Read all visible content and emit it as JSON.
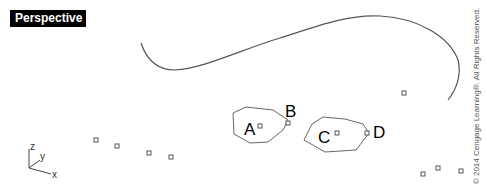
{
  "viewport": {
    "label": "Perspective"
  },
  "axis_icon": {
    "z_label": "z",
    "y_label": "y",
    "x_label": "x"
  },
  "labels": {
    "A": "A",
    "B": "B",
    "C": "C",
    "D": "D"
  },
  "copyright": "© 2014 Cengage Learning®. All Rights Reserved.",
  "colors": {
    "background": "#ffffff",
    "geometry": "#555555",
    "label_bg": "#000000",
    "label_fg": "#ffffff"
  }
}
